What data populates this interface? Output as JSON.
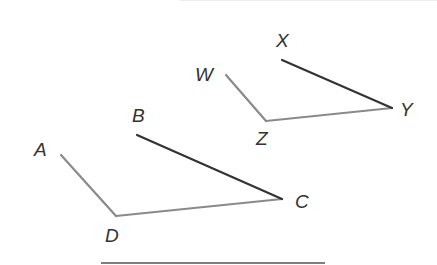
{
  "figure": {
    "colors": {
      "light_segment": "#8a8a8a",
      "dark_segment": "#333333",
      "label": "#333333",
      "rule_line": "#555555",
      "top_rule": "#eeeeee"
    },
    "points": {
      "A": {
        "label": "A",
        "x": 61,
        "y": 155
      },
      "B": {
        "label": "B",
        "x": 137,
        "y": 135
      },
      "C": {
        "label": "C",
        "x": 282,
        "y": 199
      },
      "D": {
        "label": "D",
        "x": 116,
        "y": 216
      },
      "W": {
        "label": "W",
        "x": 226,
        "y": 75
      },
      "X": {
        "label": "X",
        "x": 282,
        "y": 60
      },
      "Y": {
        "label": "Y",
        "x": 392,
        "y": 108
      },
      "Z": {
        "label": "Z",
        "x": 266,
        "y": 121
      }
    },
    "segments": [
      {
        "name": "AD",
        "style": "light"
      },
      {
        "name": "DC",
        "style": "light"
      },
      {
        "name": "BC",
        "style": "dark"
      },
      {
        "name": "WZ",
        "style": "light"
      },
      {
        "name": "ZY",
        "style": "light"
      },
      {
        "name": "XY",
        "style": "dark"
      }
    ]
  }
}
